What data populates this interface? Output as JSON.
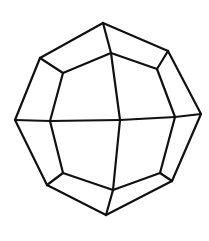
{
  "diagram": {
    "title": "",
    "type": "polyhedron-line-drawing",
    "stroke_color": "#111111",
    "stroke_width": 2.2,
    "background": "#ffffff",
    "vertices": {
      "top": [
        103,
        23
      ],
      "outer_upper_right": [
        168,
        51
      ],
      "right": [
        201,
        114
      ],
      "outer_lower_right": [
        172,
        181
      ],
      "bottom": [
        106,
        215
      ],
      "outer_lower_left": [
        47,
        185
      ],
      "left": [
        15,
        120
      ],
      "outer_upper_left": [
        40,
        58
      ],
      "inner_top": [
        111,
        53
      ],
      "inner_upper_right": [
        157,
        69
      ],
      "inner_right": [
        175,
        117
      ],
      "inner_lower_right": [
        160,
        173
      ],
      "inner_bottom": [
        113,
        190
      ],
      "inner_lower_left": [
        63,
        173
      ],
      "inner_left": [
        50,
        121
      ],
      "inner_upper_left": [
        63,
        73
      ],
      "center": [
        120,
        120
      ]
    },
    "edges": [
      [
        "top",
        "outer_upper_right"
      ],
      [
        "outer_upper_right",
        "right"
      ],
      [
        "right",
        "outer_lower_right"
      ],
      [
        "outer_lower_right",
        "bottom"
      ],
      [
        "bottom",
        "outer_lower_left"
      ],
      [
        "outer_lower_left",
        "left"
      ],
      [
        "left",
        "outer_upper_left"
      ],
      [
        "outer_upper_left",
        "top"
      ],
      [
        "inner_top",
        "inner_upper_right"
      ],
      [
        "inner_upper_right",
        "inner_right"
      ],
      [
        "inner_right",
        "inner_lower_right"
      ],
      [
        "inner_lower_right",
        "inner_bottom"
      ],
      [
        "inner_bottom",
        "inner_lower_left"
      ],
      [
        "inner_lower_left",
        "inner_left"
      ],
      [
        "inner_left",
        "inner_upper_left"
      ],
      [
        "inner_upper_left",
        "inner_top"
      ],
      [
        "top",
        "inner_top"
      ],
      [
        "outer_upper_right",
        "inner_upper_right"
      ],
      [
        "right",
        "inner_right"
      ],
      [
        "outer_lower_right",
        "inner_lower_right"
      ],
      [
        "bottom",
        "inner_bottom"
      ],
      [
        "outer_lower_left",
        "inner_lower_left"
      ],
      [
        "left",
        "inner_left"
      ],
      [
        "outer_upper_left",
        "inner_upper_left"
      ],
      [
        "inner_top",
        "center"
      ],
      [
        "center",
        "inner_bottom"
      ],
      [
        "inner_left",
        "center"
      ],
      [
        "center",
        "inner_right"
      ]
    ]
  }
}
